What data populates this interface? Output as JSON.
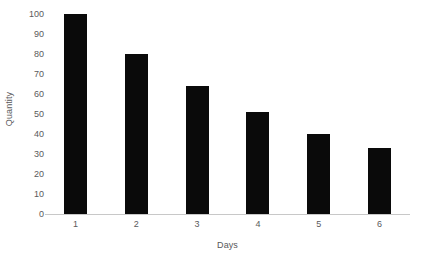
{
  "chart_data": {
    "type": "bar",
    "title": "",
    "subtitle": "",
    "xlabel": "Days",
    "ylabel": "Quantity",
    "categories": [
      "1",
      "2",
      "3",
      "4",
      "5",
      "6"
    ],
    "values": [
      100,
      80,
      64,
      51,
      40,
      33
    ],
    "series": [
      {
        "name": "Quantity",
        "values": [
          100,
          80,
          64,
          51,
          40,
          33
        ]
      }
    ],
    "ylim": [
      0,
      100
    ],
    "yticks": [
      0,
      10,
      20,
      30,
      40,
      50,
      60,
      70,
      80,
      90,
      100
    ],
    "ytick_labels": [
      "0",
      "10",
      "20",
      "30",
      "40",
      "50",
      "60",
      "70",
      "80",
      "90",
      "100"
    ],
    "grid": false,
    "legend": false,
    "legend_position": "none",
    "bar_color": "#0a0a0a",
    "axis_color": "#c8c8c8",
    "tick_label_color": "#5a5a5c",
    "axis_title_color": "#58585a",
    "background_color": "#ffffff",
    "annotations": []
  }
}
